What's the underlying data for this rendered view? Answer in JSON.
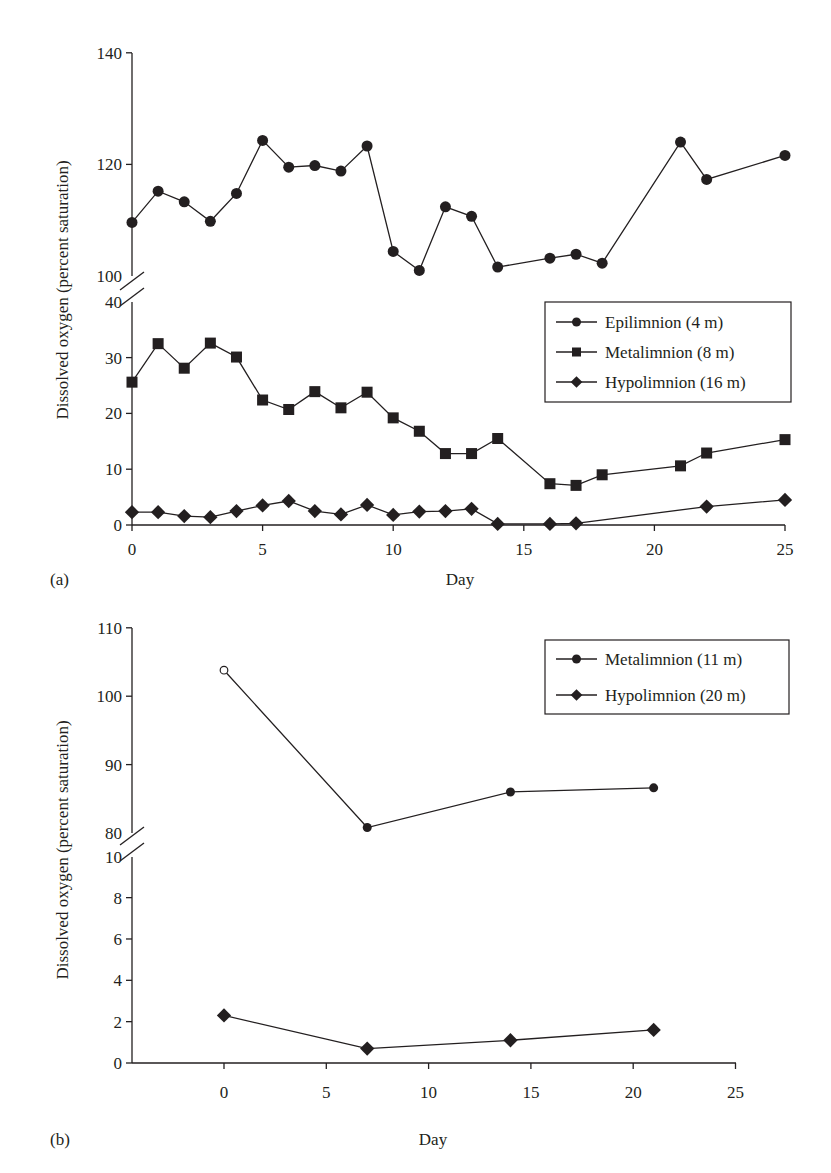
{
  "panels": [
    {
      "id": "a",
      "panel_label": "(a)",
      "xlabel": "Day",
      "ylabel": "Dissolved oxygen (percent saturation)",
      "legend": [
        {
          "label": "Epilimnion (4 m)",
          "marker": "circle"
        },
        {
          "label": "Metalimnion (8 m)",
          "marker": "square"
        },
        {
          "label": "Hypolimnion (16 m)",
          "marker": "diamond"
        }
      ],
      "x_ticks": [
        "0",
        "5",
        "10",
        "15",
        "20",
        "25"
      ],
      "y_ticks_upper": [
        "100",
        "120",
        "140"
      ],
      "y_ticks_lower": [
        "0",
        "10",
        "20",
        "30",
        "40"
      ]
    },
    {
      "id": "b",
      "panel_label": "(b)",
      "xlabel": "Day",
      "ylabel": "Dissolved oxygen (percent saturation)",
      "legend": [
        {
          "label": "Metalimnion (11 m)",
          "marker": "circle"
        },
        {
          "label": "Hypolimnion (20 m)",
          "marker": "diamond"
        }
      ],
      "x_ticks": [
        "0",
        "5",
        "10",
        "15",
        "20",
        "25"
      ],
      "y_ticks_upper": [
        "80",
        "90",
        "100",
        "110"
      ],
      "y_ticks_lower": [
        "0",
        "2",
        "4",
        "6",
        "8",
        "10"
      ]
    }
  ],
  "chart_data": [
    {
      "type": "line",
      "title": "(a)",
      "xlabel": "Day",
      "ylabel": "Dissolved oxygen (percent saturation)",
      "xlim": [
        0,
        25
      ],
      "ylim": [
        0,
        140
      ],
      "y_axis_break": {
        "lower": [
          0,
          40
        ],
        "upper": [
          100,
          140
        ]
      },
      "grid": false,
      "legend_position": "inside right, below axis break",
      "series": [
        {
          "name": "Epilimnion (4 m)",
          "marker": "circle",
          "x": [
            0,
            1,
            2,
            3,
            4,
            5,
            6,
            7,
            8,
            9,
            10,
            11,
            12,
            13,
            14,
            16,
            17,
            18,
            21,
            22,
            25
          ],
          "values": [
            109.6,
            115.2,
            113.3,
            109.8,
            114.8,
            124.3,
            119.5,
            119.8,
            118.8,
            123.3,
            104.4,
            101.0,
            112.4,
            110.7,
            101.6,
            103.2,
            103.9,
            102.3,
            124.0,
            117.3,
            121.6
          ]
        },
        {
          "name": "Metalimnion (8 m)",
          "marker": "square",
          "x": [
            0,
            1,
            2,
            3,
            4,
            5,
            6,
            7,
            8,
            9,
            10,
            11,
            12,
            13,
            14,
            16,
            17,
            18,
            21,
            22,
            25
          ],
          "values": [
            25.6,
            32.5,
            28.1,
            32.6,
            30.1,
            22.4,
            20.7,
            23.9,
            21.0,
            23.8,
            19.2,
            16.8,
            12.8,
            12.8,
            15.5,
            7.4,
            7.1,
            9.0,
            10.6,
            12.9,
            15.3
          ]
        },
        {
          "name": "Hypolimnion (16 m)",
          "marker": "diamond",
          "x": [
            0,
            1,
            2,
            3,
            4,
            5,
            6,
            7,
            8,
            9,
            10,
            11,
            12,
            13,
            14,
            16,
            17,
            22,
            25
          ],
          "values": [
            2.3,
            2.3,
            1.6,
            1.4,
            2.5,
            3.5,
            4.3,
            2.5,
            1.9,
            3.6,
            1.8,
            2.4,
            2.5,
            2.9,
            0.2,
            0.2,
            0.3,
            3.3,
            4.5
          ]
        }
      ]
    },
    {
      "type": "line",
      "title": "(b)",
      "xlabel": "Day",
      "ylabel": "Dissolved oxygen (percent saturation)",
      "xlim": [
        -4.5,
        25
      ],
      "ylim": [
        0,
        110
      ],
      "y_axis_break": {
        "lower": [
          0,
          10
        ],
        "upper": [
          80,
          110
        ]
      },
      "grid": false,
      "legend_position": "upper right",
      "series": [
        {
          "name": "Metalimnion (11 m)",
          "marker": "circle",
          "x": [
            0,
            7,
            14,
            21
          ],
          "values": [
            103.8,
            80.8,
            86.0,
            86.6
          ],
          "note": "first point (day 0) drawn as open circle"
        },
        {
          "name": "Hypolimnion (20 m)",
          "marker": "diamond",
          "x": [
            0,
            7,
            14,
            21
          ],
          "values": [
            2.3,
            0.7,
            1.1,
            1.6
          ]
        }
      ]
    }
  ]
}
